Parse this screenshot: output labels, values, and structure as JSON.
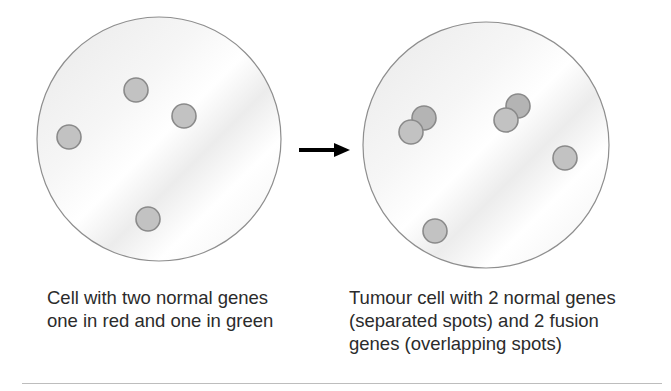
{
  "diagram": {
    "left_cell": {
      "caption_lines": [
        "Cell with two normal genes",
        "one in red and one in green"
      ],
      "spots": [
        {
          "cx": 136,
          "cy": 90
        },
        {
          "cx": 184,
          "cy": 116
        },
        {
          "cx": 69,
          "cy": 137
        },
        {
          "cx": 148,
          "cy": 219
        }
      ]
    },
    "right_cell": {
      "caption_lines": [
        "Tumour cell with 2 normal genes",
        "(separated spots) and 2 fusion",
        "genes (overlapping spots)"
      ],
      "spots": [
        {
          "cx": 424,
          "cy": 118,
          "back": true
        },
        {
          "cx": 411,
          "cy": 132
        },
        {
          "cx": 518,
          "cy": 106,
          "back": true
        },
        {
          "cx": 506,
          "cy": 120
        },
        {
          "cx": 565,
          "cy": 158
        },
        {
          "cx": 435,
          "cy": 231
        }
      ]
    },
    "arrow": "right-arrow",
    "colors": {
      "cell_outline": "#8e8e8e",
      "cell_fill": "#efefef",
      "spot_fill": "#c2c2c2",
      "spot_back_fill": "#b4b4b4",
      "spot_outline": "#8a8a8a",
      "arrow": "#000000"
    }
  }
}
